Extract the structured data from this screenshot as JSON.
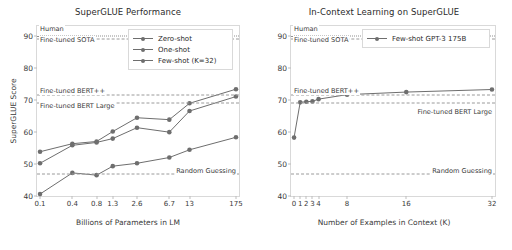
{
  "figure": {
    "background": "#ffffff",
    "line_color": "#6e6e6e",
    "ref_line_color": "#9a9a9a"
  },
  "chart_data": [
    {
      "type": "line",
      "title": "SuperGLUE Performance",
      "xlabel": "Billions of Parameters in LM",
      "ylabel": "SuperGLUE Score",
      "xscale": "log",
      "x": [
        0.1,
        0.4,
        0.8,
        1.3,
        2.6,
        6.7,
        13,
        175
      ],
      "xticklabels": [
        "0.1",
        "0.4",
        "0.8",
        "1.3",
        "2.6",
        "6.7",
        "13",
        "175"
      ],
      "yticklabels": [
        "40",
        "50",
        "60",
        "70",
        "80",
        "90"
      ],
      "ylim": [
        40,
        93
      ],
      "grid": false,
      "legend_position": "upper right",
      "series": [
        {
          "name": "Zero-shot",
          "values": [
            40.6,
            47.2,
            46.5,
            49.3,
            50.2,
            52.0,
            54.4,
            58.3
          ]
        },
        {
          "name": "One-shot",
          "values": [
            50.2,
            55.8,
            56.7,
            57.9,
            61.3,
            59.9,
            66.5,
            71.0
          ]
        },
        {
          "name": "Few-shot (K=32)",
          "values": [
            53.8,
            56.3,
            57.0,
            60.1,
            64.4,
            63.8,
            68.9,
            73.3
          ]
        }
      ],
      "reference_lines": [
        {
          "label": "Human",
          "value": 89.8,
          "style": "dotted"
        },
        {
          "label": "Fine-tuned SOTA",
          "value": 89.0,
          "style": "dashed"
        },
        {
          "label": "Fine-tuned BERT++",
          "value": 71.5,
          "style": "dashed"
        },
        {
          "label": "Fine-tuned BERT Large",
          "value": 69.0,
          "style": "dashed"
        },
        {
          "label": "Random Guessing",
          "value": 46.8,
          "style": "dashed"
        }
      ]
    },
    {
      "type": "line",
      "title": "In-Context Learning on SuperGLUE",
      "xlabel": "Number of Examples in Context (K)",
      "ylabel": "SuperGLUE Score",
      "x": [
        0,
        1,
        2,
        3,
        4,
        8,
        16,
        32
      ],
      "xticklabels": [
        "0",
        "1",
        "2",
        "3",
        "4",
        "8",
        "16",
        "32"
      ],
      "yticklabels": [
        "40",
        "50",
        "60",
        "70",
        "80",
        "90"
      ],
      "ylim": [
        40,
        93
      ],
      "grid": false,
      "legend_position": "upper right",
      "series": [
        {
          "name": "Few-shot GPT-3 175B",
          "values": [
            58.2,
            69.2,
            69.4,
            69.5,
            70.2,
            71.6,
            72.4,
            73.2
          ]
        }
      ],
      "reference_lines": [
        {
          "label": "Human",
          "value": 89.8,
          "style": "dotted"
        },
        {
          "label": "Fine-tuned SOTA",
          "value": 89.0,
          "style": "dashed"
        },
        {
          "label": "Fine-tuned BERT++",
          "value": 71.5,
          "style": "dashed"
        },
        {
          "label": "Fine-tuned BERT Large",
          "value": 69.0,
          "style": "dashed"
        },
        {
          "label": "Random Guessing",
          "value": 46.8,
          "style": "dashed"
        }
      ]
    }
  ]
}
